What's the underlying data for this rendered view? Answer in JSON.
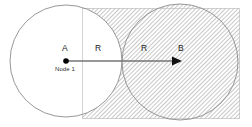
{
  "figure": {
    "width": 252,
    "height": 127,
    "background_color": "#ffffff"
  },
  "labels": {
    "point_a": "A",
    "point_b": "B",
    "radius_left": "R",
    "radius_right": "R",
    "node_caption": "Node 1"
  },
  "colors": {
    "stroke": "#808080",
    "hatch": "#9a9a9a",
    "text": "#1a1a1a",
    "node_dot": "#000000",
    "arrow": "#707070",
    "rect_border": "#b0b0b0"
  },
  "geometry": {
    "circle_a": {
      "cx": 66,
      "cy": 61,
      "r": 56,
      "fill": "none",
      "label": "A"
    },
    "circle_b": {
      "cx": 180,
      "cy": 62,
      "r": 58,
      "fill": "hatched",
      "label": "B"
    },
    "hatched_rect": {
      "x": 82,
      "y": 8,
      "width": 158,
      "height": 111
    },
    "arrow": {
      "x1": 66,
      "y1": 61,
      "x2": 180,
      "y2": 61
    },
    "node_dot": {
      "cx": 66,
      "cy": 61,
      "r": 2.6
    }
  },
  "icons": {
    "arrow_head": "arrow-right-icon",
    "node_marker": "filled-circle-icon"
  }
}
